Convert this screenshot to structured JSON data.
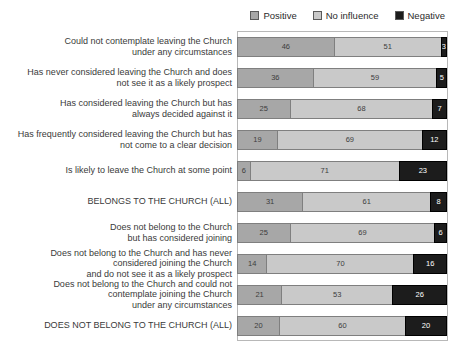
{
  "legend": {
    "position": "top-right",
    "items": [
      {
        "label": "Positive",
        "color": "#a7a7a7",
        "key": "positive"
      },
      {
        "label": "No influence",
        "color": "#c9c9c9",
        "key": "no-influence"
      },
      {
        "label": "Negative",
        "color": "#1c1c1c",
        "key": "negative"
      }
    ]
  },
  "chart_data": {
    "type": "bar",
    "orientation": "horizontal",
    "stacked": true,
    "unit": "percent",
    "xlim": [
      0,
      100
    ],
    "grid": false,
    "legend_position": "top-right",
    "title": "",
    "xlabel": "",
    "ylabel": "",
    "categories": [
      "Could not contemplate leaving the Church\nunder any circumstances",
      "Has never considered leaving the Church and does\nnot see it as a likely prospect",
      "Has considered leaving the Church but has\nalways decided against it",
      "Has frequently considered leaving the Church but has\nnot come to a clear decision",
      "Is likely to leave the Church at some point",
      "BELONGS TO THE CHURCH (ALL)",
      "Does not belong to the Church\nbut has considered joining",
      "Does not belong to the Church and has never\nconsidered joining the Church\nand do not see it as a likely prospect",
      "Does not belong to the Church and could not\ncontemplate joining the Church\nunder any circumstances",
      "DOES NOT BELONG TO THE CHURCH (ALL)"
    ],
    "series": [
      {
        "name": "Positive",
        "color": "#a7a7a7",
        "values": [
          46,
          36,
          25,
          19,
          6,
          31,
          25,
          14,
          21,
          20
        ]
      },
      {
        "name": "No influence",
        "color": "#c9c9c9",
        "values": [
          51,
          59,
          68,
          69,
          71,
          61,
          69,
          70,
          53,
          60
        ]
      },
      {
        "name": "Negative",
        "color": "#1c1c1c",
        "values": [
          3,
          5,
          7,
          12,
          23,
          8,
          6,
          16,
          26,
          20
        ]
      }
    ]
  }
}
